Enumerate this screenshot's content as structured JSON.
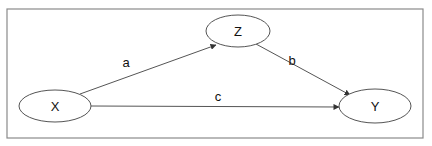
{
  "diagram": {
    "type": "path-diagram",
    "frame": {
      "x": 7,
      "y": 9,
      "width": 416,
      "height": 129,
      "stroke": "#8a8a8a"
    },
    "colors": {
      "line": "#555555",
      "node_stroke": "#555555",
      "node_fill": "#ffffff",
      "text": "#111111"
    },
    "nodes": [
      {
        "id": "X",
        "label": "X",
        "cx": 55,
        "cy": 106,
        "rx": 36,
        "ry": 16
      },
      {
        "id": "Z",
        "label": "Z",
        "cx": 238,
        "cy": 31,
        "rx": 32,
        "ry": 16
      },
      {
        "id": "Y",
        "label": "Y",
        "cx": 375,
        "cy": 106,
        "rx": 36,
        "ry": 17
      }
    ],
    "edges": [
      {
        "id": "a",
        "from": "X",
        "to": "Z",
        "label": "a",
        "x1": 80,
        "y1": 94,
        "x2": 216,
        "y2": 45,
        "lx": 126,
        "ly": 67
      },
      {
        "id": "b",
        "from": "Z",
        "to": "Y",
        "label": "b",
        "x1": 256,
        "y1": 44,
        "x2": 350,
        "y2": 95,
        "lx": 292,
        "ly": 65
      },
      {
        "id": "c",
        "from": "X",
        "to": "Y",
        "label": "c",
        "x1": 91,
        "y1": 106,
        "x2": 339,
        "y2": 107,
        "lx": 218,
        "ly": 101
      }
    ]
  }
}
